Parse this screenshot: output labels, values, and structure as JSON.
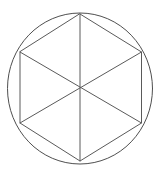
{
  "figure": {
    "title": "Circle with inscribed regular hexagon and three main diagonals",
    "background_color": "#ffffff",
    "stroke_color": "#5a5a5a",
    "circle_stroke_color": "#4f4f4f",
    "stroke_width": 1,
    "canvas": {
      "width": 160,
      "height": 175
    }
  },
  "geometry": {
    "circle": {
      "label": "circumscribed-circle",
      "center_x": 80,
      "center_y": 88.5,
      "radius_x": 72.5,
      "radius_y": 75.5,
      "left_edge_x": 7.5,
      "right_edge_x": 152.5,
      "top_edge_y": 13,
      "bottom_edge_y": 164
    },
    "center_point": {
      "label": "center",
      "x": 80,
      "y": 88.5
    },
    "hexagon": {
      "label": "inscribed-hexagon",
      "sides": 6,
      "vertices": [
        {
          "name": "top",
          "x": 80,
          "y": 14
        },
        {
          "name": "upper-right",
          "x": 141.5,
          "y": 52
        },
        {
          "name": "lower-right",
          "x": 141.5,
          "y": 123
        },
        {
          "name": "bottom",
          "x": 80,
          "y": 161
        },
        {
          "name": "lower-left",
          "x": 20,
          "y": 123
        },
        {
          "name": "upper-left",
          "x": 20,
          "y": 52
        }
      ],
      "edges": [
        {
          "name": "edge-top-right",
          "from": "top",
          "to": "upper-right"
        },
        {
          "name": "edge-right",
          "from": "upper-right",
          "to": "lower-right"
        },
        {
          "name": "edge-bottom-right",
          "from": "lower-right",
          "to": "bottom"
        },
        {
          "name": "edge-bottom-left",
          "from": "bottom",
          "to": "lower-left"
        },
        {
          "name": "edge-left",
          "from": "lower-left",
          "to": "upper-left"
        },
        {
          "name": "edge-top-left",
          "from": "upper-left",
          "to": "top"
        }
      ]
    },
    "diagonals": [
      {
        "name": "diagonal-vertical",
        "from": "top",
        "to": "bottom"
      },
      {
        "name": "diagonal-upper-left-to-lower-right",
        "from": "upper-left",
        "to": "lower-right"
      },
      {
        "name": "diagonal-upper-right-to-lower-left",
        "from": "upper-right",
        "to": "lower-left"
      }
    ],
    "triangle_count": 6
  },
  "chart_data": {
    "type": "diagram",
    "title": "Circle with inscribed regular hexagon",
    "shapes": [
      "circle",
      "hexagon",
      "diagonal",
      "diagonal",
      "diagonal"
    ],
    "annotations": [],
    "legend": [],
    "grid": false
  }
}
